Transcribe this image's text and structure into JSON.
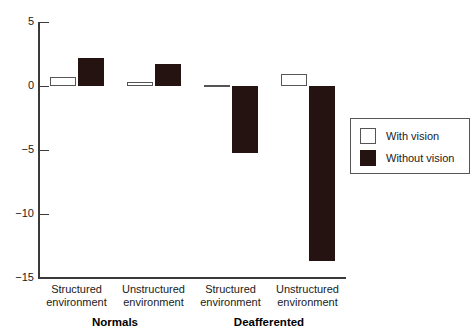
{
  "chart_data": {
    "type": "bar",
    "title": "",
    "xlabel": "",
    "ylabel": "",
    "ylim": [
      -15,
      5
    ],
    "grid": false,
    "legend_position": "right",
    "y_ticks": [
      {
        "value": 5,
        "label": "5"
      },
      {
        "value": 0,
        "label": "0"
      },
      {
        "value": -5,
        "label": "−5"
      },
      {
        "value": -10,
        "label": "−10"
      },
      {
        "value": -15,
        "label": "−15"
      }
    ],
    "group_labels": [
      "Normals",
      "Deafferented"
    ],
    "categories": [
      {
        "line1": "Structured",
        "line2": "environment",
        "group": "Normals"
      },
      {
        "line1": "Unstructured",
        "line2": "environment",
        "group": "Normals"
      },
      {
        "line1": "Structured",
        "line2": "environment",
        "group": "Deafferented"
      },
      {
        "line1": "Unstructured",
        "line2": "environment",
        "group": "Deafferented"
      }
    ],
    "series": [
      {
        "name": "With vision",
        "style": "open",
        "color": "#ffffff",
        "edge_color": "#555555",
        "values": [
          0.7,
          0.35,
          0.05,
          0.9
        ]
      },
      {
        "name": "Without vision",
        "style": "filled",
        "color": "#241310",
        "edge_color": "#241310",
        "values": [
          2.2,
          1.7,
          -5.2,
          -13.7
        ]
      }
    ]
  },
  "legend": {
    "items": [
      {
        "label": "With vision",
        "style": "open"
      },
      {
        "label": "Without vision",
        "style": "filled"
      }
    ]
  }
}
